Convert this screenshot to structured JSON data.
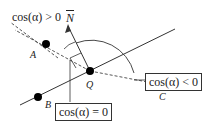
{
  "diagram": {
    "type": "geometry-normal-vector-cosine",
    "points": [
      {
        "id": "A",
        "label": "A",
        "x": 46,
        "y": 44
      },
      {
        "id": "B",
        "label": "B",
        "x": 38,
        "y": 97
      },
      {
        "id": "Q",
        "label": "Q",
        "x": 90,
        "y": 71
      },
      {
        "id": "C",
        "label": "C",
        "x": 163,
        "y": 85
      }
    ],
    "normal": {
      "label": "N",
      "overline": true
    },
    "labels": {
      "cos_positive": "cos(α) > 0",
      "cos_negative": "cos(α) < 0",
      "cos_zero": "cos(α) = 0"
    },
    "colors": {
      "line": "#333333",
      "point": "#000000",
      "background": "#ffffff"
    }
  }
}
